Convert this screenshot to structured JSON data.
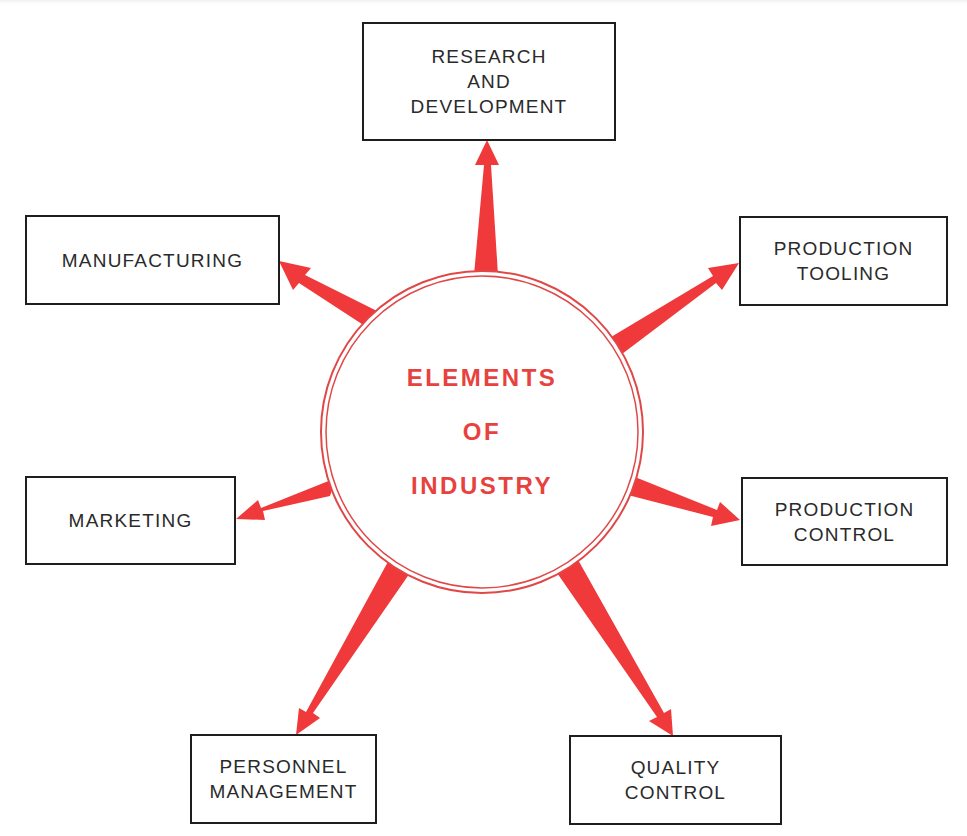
{
  "diagram": {
    "title": "Elements of Industry",
    "hub": {
      "lines": [
        "ELEMENTS",
        "OF",
        "INDUSTRY"
      ],
      "color": "#e8423f",
      "ring_color": "#e04848"
    },
    "arrow_color": "#f0393a",
    "box_border_color": "#1e1e1e",
    "nodes": [
      {
        "id": "research-and-development",
        "lines": [
          "RESEARCH",
          "AND",
          "DEVELOPMENT"
        ]
      },
      {
        "id": "manufacturing",
        "lines": [
          "MANUFACTURING"
        ]
      },
      {
        "id": "production-tooling",
        "lines": [
          "PRODUCTION",
          "TOOLING"
        ]
      },
      {
        "id": "marketing",
        "lines": [
          "MARKETING"
        ]
      },
      {
        "id": "production-control",
        "lines": [
          "PRODUCTION",
          "CONTROL"
        ]
      },
      {
        "id": "personnel-management",
        "lines": [
          "PERSONNEL",
          "MANAGEMENT"
        ]
      },
      {
        "id": "quality-control",
        "lines": [
          "QUALITY",
          "CONTROL"
        ]
      }
    ],
    "edges": [
      {
        "from": "hub",
        "to": "research-and-development"
      },
      {
        "from": "hub",
        "to": "manufacturing"
      },
      {
        "from": "hub",
        "to": "production-tooling"
      },
      {
        "from": "hub",
        "to": "marketing"
      },
      {
        "from": "hub",
        "to": "production-control"
      },
      {
        "from": "hub",
        "to": "personnel-management"
      },
      {
        "from": "hub",
        "to": "quality-control"
      }
    ]
  }
}
